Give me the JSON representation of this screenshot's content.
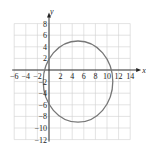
{
  "chart_data": {
    "type": "line",
    "title": "",
    "xlabel": "x",
    "ylabel": "y",
    "xlim": [
      -6,
      14
    ],
    "ylim": [
      -12,
      8
    ],
    "grid": true,
    "grid_step": 2,
    "xticks": [
      -6,
      -4,
      -2,
      2,
      4,
      6,
      8,
      10,
      12,
      14
    ],
    "yticks": [
      8,
      6,
      4,
      2,
      -2,
      -4,
      -6,
      -8,
      -10,
      -12
    ],
    "series": [
      {
        "name": "ellipse",
        "shape": "ellipse",
        "center": [
          5,
          -2
        ],
        "semi_axis_x": 6,
        "semi_axis_y": 7,
        "extrema": {
          "top": [
            5,
            5
          ],
          "bottom": [
            5,
            -9
          ],
          "left": [
            -1,
            -2
          ],
          "right": [
            11,
            -2
          ]
        },
        "color": "#777777"
      }
    ]
  },
  "colors": {
    "grid": "#d0d0d0",
    "axis": "#222222",
    "curve": "#777777"
  }
}
